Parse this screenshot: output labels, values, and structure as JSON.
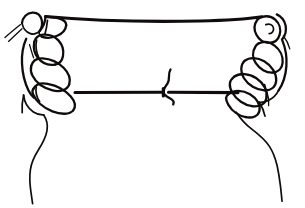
{
  "image": {
    "title": "Two hands holding a taut string",
    "subject": "line-drawing of a pair of hands pulling a length of string or thread taut between them",
    "style": "black ink line art on plain white background, no shading, no color fill",
    "background_color": "#ffffff",
    "ink_color": "#100c0c",
    "width": 305,
    "height": 208,
    "alt_text": "Simple black and white line drawing of two hands, seen from the back, gripping a string that runs horizontally across the picture; an upper strand passes over the thumbs and a lower strand passes through the curled fingers, with a small knot near the middle of the lower strand."
  },
  "elements": {
    "left_hand_label": "Left hand gripping string",
    "right_hand_label": "Right hand gripping string",
    "upper_strand_label": "Upper string strand",
    "lower_strand_label": "Lower string strand",
    "knot_label": "Knot in string",
    "loose_ends_label": "Loose thread ends",
    "left_thumb_label": "Left thumb",
    "right_thumb_label": "Right thumb",
    "right_thumbnail_label": "Right thumbnail",
    "left_forearm_label": "Left forearm",
    "right_forearm_label": "Right forearm"
  },
  "annotations": {
    "upper_strand": {
      "starts_at_x": 45,
      "ends_at_x": 262,
      "y_at_ends": 17,
      "sag_description": "slight downward sag to about y=21 at midspan"
    },
    "lower_strand": {
      "starts_at_x": 75,
      "ends_at_x": 238,
      "y": 92,
      "knot_x": 165
    },
    "counts": {
      "hands": 2,
      "string_strands": 2,
      "knots": 1,
      "loose_ends": 2
    }
  }
}
